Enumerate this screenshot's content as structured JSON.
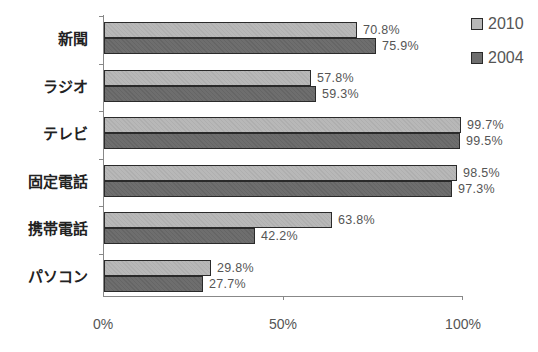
{
  "chart_data": {
    "type": "bar",
    "orientation": "horizontal",
    "title": "",
    "xlabel": "",
    "ylabel": "",
    "xlim": [
      0,
      100
    ],
    "x_ticks": [
      "0%",
      "50%",
      "100%"
    ],
    "categories": [
      "新聞",
      "ラジオ",
      "テレビ",
      "固定電話",
      "携帯電話",
      "パソコン"
    ],
    "series": [
      {
        "name": "2010",
        "color": "#b8b8b8",
        "values": [
          70.8,
          57.8,
          99.7,
          98.5,
          63.8,
          29.8
        ],
        "labels": [
          "70.8%",
          "57.8%",
          "99.7%",
          "98.5%",
          "63.8%",
          "29.8%"
        ]
      },
      {
        "name": "2004",
        "color": "#6e6e6e",
        "values": [
          75.9,
          59.3,
          99.5,
          97.3,
          42.2,
          27.7
        ],
        "labels": [
          "75.9%",
          "59.3%",
          "99.5%",
          "97.3%",
          "42.2%",
          "27.7%"
        ]
      }
    ],
    "legend": {
      "position": "top-right",
      "entries": [
        "2010",
        "2004"
      ]
    },
    "grid": false,
    "data_labels": true
  }
}
